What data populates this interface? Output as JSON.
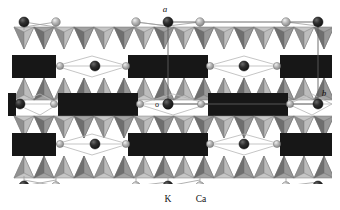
{
  "figure": {
    "kind": "crystal-structure-polyhedral-projection",
    "background_color": "#ffffff"
  },
  "axes": {
    "a_label": "a",
    "b_label": "b",
    "origin_label": "o"
  },
  "legend": {
    "items": [
      {
        "label": "K",
        "marker": "dark-sphere",
        "color": "#2b2b2b"
      },
      {
        "label": "Ca",
        "marker": "light-sphere",
        "color": "#9a9a9a"
      }
    ]
  },
  "palette": {
    "octahedra_block": "#181818",
    "tetra_light": "#c9c9c9",
    "tetra_mid": "#a8a8a8",
    "tetra_dark": "#8a8a8a",
    "tetra_shadow": "#6f6f6f",
    "bond_line": "#9d9d9d",
    "cell_line": "#6a6a6a",
    "k_sphere": "#2b2b2b",
    "ca_sphere": "#a5a5a5",
    "outline": "#555555"
  },
  "structure": {
    "rows": [
      {
        "name": "tetra-band-top",
        "y": 22,
        "height": 30,
        "type": "tetrahedra"
      },
      {
        "name": "octahedra-band-1",
        "y": 52,
        "height": 26,
        "type": "octahedra",
        "offset": 0
      },
      {
        "name": "tetra-band-2",
        "y": 78,
        "height": 30,
        "type": "tetrahedra"
      },
      {
        "name": "octahedra-band-2",
        "y": 88,
        "height": 26,
        "type": "octahedra",
        "offset": 1
      },
      {
        "name": "tetra-band-3",
        "y": 114,
        "height": 30,
        "type": "tetrahedra"
      },
      {
        "name": "octahedra-band-3",
        "y": 130,
        "height": 26,
        "type": "octahedra",
        "offset": 0
      },
      {
        "name": "tetra-band-bottom",
        "y": 156,
        "height": 30,
        "type": "tetrahedra"
      }
    ],
    "unit_cell": {
      "left": 168,
      "right": 310,
      "top": 26,
      "bottom": 104
    }
  }
}
